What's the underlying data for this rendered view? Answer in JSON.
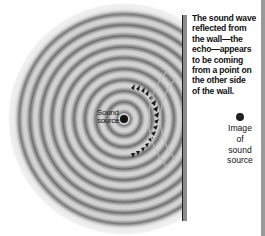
{
  "diagram": {
    "caption_lines": [
      "The sound wave",
      "reflected from",
      "the wall—the",
      "echo—appears",
      "to be coming",
      "from a point on",
      "the other side",
      "of the wall."
    ],
    "source_label": [
      "Sound",
      "source"
    ],
    "image_label": [
      "Image",
      "of",
      "sound",
      "source"
    ],
    "elements": {
      "sound_source": {
        "x": 124,
        "y": 119
      },
      "image_source": {
        "x": 240,
        "y": 117
      },
      "wall": {
        "x": 184,
        "y_top": 15,
        "y_bottom": 221
      },
      "wave_rings": {
        "count": 10,
        "wavelength_px": 11,
        "max_radius_px": 113
      },
      "reflected_arrowheads": 16
    },
    "colors": {
      "ring_dark": "#6e6e6e",
      "ring_light": "#d2d2d2",
      "wall": "#8c8c8c",
      "wall_edge": "#1e1e1e",
      "dot": "#111111",
      "background": "#ffffff"
    }
  }
}
